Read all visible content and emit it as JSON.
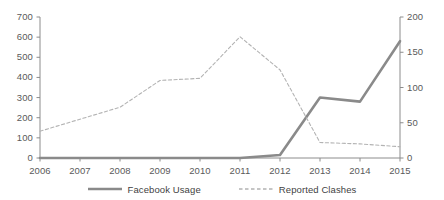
{
  "chart_data": {
    "type": "line",
    "title": "",
    "subtitle": "",
    "xlabel": "",
    "ylabel": "",
    "grid": false,
    "legend_position": "bottom",
    "categories": [
      "2006",
      "2007",
      "2008",
      "2009",
      "2010",
      "2011",
      "2012",
      "2013",
      "2014",
      "2015"
    ],
    "x": [
      2006,
      2007,
      2008,
      2009,
      2010,
      2011,
      2012,
      2013,
      2014,
      2015
    ],
    "axes": {
      "left": {
        "label": "",
        "min": 0,
        "max": 700,
        "step": 100,
        "ticks": [
          "0",
          "100",
          "200",
          "300",
          "400",
          "500",
          "600",
          "700"
        ],
        "tick_values": [
          0,
          100,
          200,
          300,
          400,
          500,
          600,
          700
        ]
      },
      "right": {
        "label": "",
        "min": 0,
        "max": 200,
        "step": 50,
        "ticks": [
          "0",
          "50",
          "100",
          "150",
          "200"
        ],
        "tick_values": [
          0,
          50,
          100,
          150,
          200
        ]
      },
      "x": {
        "min": 2006,
        "max": 2015,
        "ticks": [
          "2006",
          "2007",
          "2008",
          "2009",
          "2010",
          "2011",
          "2012",
          "2013",
          "2014",
          "2015"
        ]
      }
    },
    "series": [
      {
        "name": "Facebook Usage",
        "axis": "left",
        "style": "solid",
        "color": "#8a8a8a",
        "width": 2.6,
        "values": [
          0,
          0,
          0,
          0,
          0,
          0,
          15,
          300,
          280,
          580
        ]
      },
      {
        "name": "Reported Clashes",
        "axis": "right",
        "style": "dashed",
        "color": "#b3b3b3",
        "width": 1.1,
        "values": [
          38,
          55,
          72,
          110,
          113,
          172,
          125,
          22,
          20,
          16
        ]
      }
    ]
  },
  "legend": {
    "items": [
      {
        "label": "Facebook Usage",
        "style": "solid",
        "color": "#8a8a8a"
      },
      {
        "label": "Reported Clashes",
        "style": "dashed",
        "color": "#b3b3b3"
      }
    ]
  },
  "colors": {
    "facebook_usage": "#8a8a8a",
    "reported_clashes": "#b3b3b3",
    "axis": "#8c8c8c",
    "text": "#4a4a4a",
    "background": "#ffffff"
  }
}
